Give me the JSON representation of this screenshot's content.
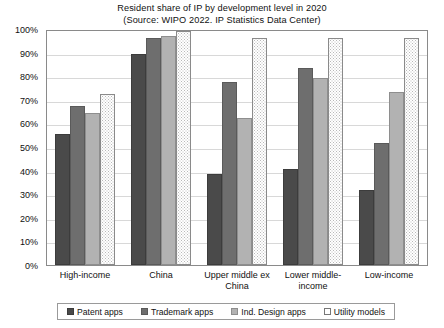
{
  "chart_data": {
    "type": "bar",
    "title": "Resident share of IP by development level in 2020",
    "subtitle": "(Source: WIPO 2022. IP Statistics Data Center)",
    "xlabel": "",
    "ylabel": "",
    "ylim": [
      0,
      100
    ],
    "ytick_labels": [
      "100%",
      "90%",
      "80%",
      "70%",
      "60%",
      "50%",
      "40%",
      "30%",
      "20%",
      "10%",
      "0%"
    ],
    "ytick_values": [
      100,
      90,
      80,
      70,
      60,
      50,
      40,
      30,
      20,
      10,
      0
    ],
    "grid": true,
    "legend_position": "bottom",
    "categories": [
      "High-income",
      "China",
      "Upper middle ex China",
      "Lower middle-income",
      "Low-income"
    ],
    "series": [
      {
        "name": "Patent apps",
        "color": "#4a4a4a",
        "values": [
          56,
          90,
          39,
          41,
          32
        ]
      },
      {
        "name": "Trademark apps",
        "color": "#6e6e6e",
        "values": [
          68,
          97,
          78,
          84,
          52
        ]
      },
      {
        "name": "Ind. Design apps",
        "color": "#b2b2b2",
        "values": [
          65,
          98,
          63,
          80,
          74
        ]
      },
      {
        "name": "Utility models",
        "color": "#ffffff",
        "values": [
          73,
          100,
          97,
          97,
          97
        ]
      }
    ]
  }
}
